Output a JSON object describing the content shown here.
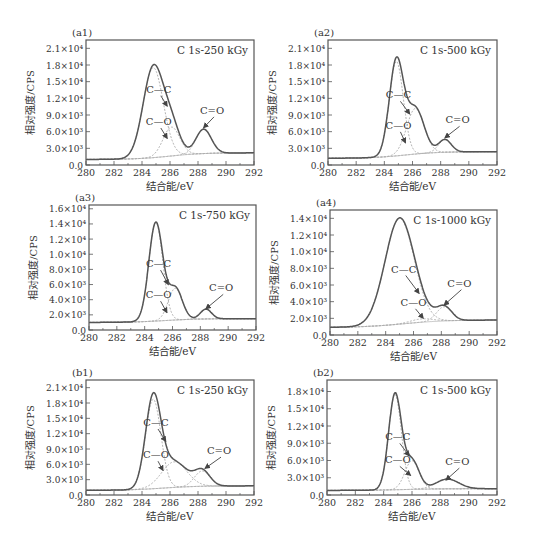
{
  "figure": {
    "common": {
      "xlabel": "结合能/eV",
      "ylabel": "相对强度/CPS",
      "x_ticks": [
        280,
        282,
        284,
        286,
        288,
        290,
        292
      ],
      "xlim": [
        280,
        292
      ],
      "line_color": "#555555",
      "fit_color": "#aaaaaa"
    }
  },
  "chart_data": [
    {
      "id": "a1",
      "panel_label": "(a1)",
      "type": "line",
      "title": "C 1s-250 kGy",
      "xlabel": "结合能/eV",
      "ylabel": "相对强度/CPS",
      "xlim": [
        280,
        292
      ],
      "ylim": [
        0,
        22500
      ],
      "y_ticks": [
        0,
        3000,
        6000,
        9000,
        12000,
        15000,
        18000,
        21000
      ],
      "y_tick_labels": [
        "0.0",
        "3.0×10³",
        "6.0×10³",
        "9.0×10³",
        "1.2×10⁴",
        "1.5×10⁴",
        "1.8×10⁴",
        "2.1×10⁴"
      ],
      "baseline": {
        "start": 1000,
        "end": 2200,
        "center": 286,
        "width": 1.2
      },
      "peaks": [
        {
          "name": "C—C",
          "center": 284.8,
          "height": 16200,
          "sigma": 0.72
        },
        {
          "name": "C—O",
          "center": 286.1,
          "height": 5200,
          "sigma": 0.6
        },
        {
          "name": "C=O",
          "center": 288.4,
          "height": 4400,
          "sigma": 0.55
        }
      ],
      "annotations": [
        {
          "text": "C—C",
          "tx": 285.2,
          "ty": 13000,
          "ax": 285.8,
          "ay": 10600
        },
        {
          "text": "C—O",
          "tx": 285.2,
          "ty": 7200,
          "ax": 285.8,
          "ay": 4800
        },
        {
          "text": "C=O",
          "tx": 289.0,
          "ty": 9200,
          "ax": 288.4,
          "ay": 6700
        }
      ],
      "box": {
        "x": 86,
        "y": 40,
        "w": 168,
        "h": 125
      }
    },
    {
      "id": "a2",
      "panel_label": "(a2)",
      "type": "line",
      "title": "C 1s-500 kGy",
      "xlabel": "结合能/eV",
      "ylabel": "相对强度/CPS",
      "xlim": [
        280,
        292
      ],
      "ylim": [
        0,
        22500
      ],
      "y_ticks": [
        0,
        3000,
        6000,
        9000,
        12000,
        15000,
        18000,
        21000
      ],
      "y_tick_labels": [
        "0.0",
        "3.0×10³",
        "6.0×10³",
        "9.0×10³",
        "1.2×10⁴",
        "1.5×10⁴",
        "1.8×10⁴",
        "2.1×10⁴"
      ],
      "baseline": {
        "start": 1200,
        "end": 2400,
        "center": 285.5,
        "width": 1.2
      },
      "peaks": [
        {
          "name": "C—C",
          "center": 284.85,
          "height": 17000,
          "sigma": 0.5
        },
        {
          "name": "C—O",
          "center": 286.2,
          "height": 8200,
          "sigma": 0.62
        },
        {
          "name": "C=O",
          "center": 288.3,
          "height": 2300,
          "sigma": 0.45
        }
      ],
      "annotations": [
        {
          "text": "C—C",
          "tx": 285.0,
          "ty": 12000,
          "ax": 285.8,
          "ay": 9200
        },
        {
          "text": "C—O",
          "tx": 285.0,
          "ty": 6500,
          "ax": 285.5,
          "ay": 4000
        },
        {
          "text": "C=O",
          "tx": 289.2,
          "ty": 7500,
          "ax": 288.3,
          "ay": 4900
        }
      ],
      "box": {
        "x": 328,
        "y": 40,
        "w": 169,
        "h": 125
      }
    },
    {
      "id": "a3",
      "panel_label": "(a3)",
      "type": "line",
      "title": "C 1s-750 kGy",
      "xlabel": "结合能/eV",
      "ylabel": "相对强度/CPS",
      "xlim": [
        280,
        292
      ],
      "ylim": [
        0,
        16500
      ],
      "y_ticks": [
        0,
        2000,
        4000,
        6000,
        8000,
        10000,
        12000,
        14000,
        16000
      ],
      "y_tick_labels": [
        "0.0",
        "2.0×10³",
        "4.0×10³",
        "6.0×10³",
        "8.0×10³",
        "1.0×10⁴",
        "1.2×10⁴",
        "1.4×10⁴",
        "1.6×10⁴"
      ],
      "baseline": {
        "start": 1000,
        "end": 1500,
        "center": 285.5,
        "width": 1.2
      },
      "peaks": [
        {
          "name": "C—C",
          "center": 284.8,
          "height": 13000,
          "sigma": 0.5
        },
        {
          "name": "C—O",
          "center": 286.2,
          "height": 4200,
          "sigma": 0.5
        },
        {
          "name": "C=O",
          "center": 288.4,
          "height": 1300,
          "sigma": 0.4
        }
      ],
      "annotations": [
        {
          "text": "C—C",
          "tx": 285.0,
          "ty": 8300,
          "ax": 285.7,
          "ay": 6000
        },
        {
          "text": "C—O",
          "tx": 285.0,
          "ty": 4200,
          "ax": 285.6,
          "ay": 2300
        },
        {
          "text": "C=O",
          "tx": 289.5,
          "ty": 5100,
          "ax": 288.4,
          "ay": 2800
        }
      ],
      "box": {
        "x": 89,
        "y": 205,
        "w": 167,
        "h": 125
      }
    },
    {
      "id": "a4",
      "panel_label": "(a4)",
      "type": "line",
      "title": "C 1s-1000 kGy",
      "xlabel": "结合能/eV",
      "ylabel": "相对强度/CPS",
      "xlim": [
        280,
        292
      ],
      "ylim": [
        0,
        15000
      ],
      "y_ticks": [
        0,
        2000,
        4000,
        6000,
        8000,
        10000,
        12000,
        14000
      ],
      "y_tick_labels": [
        "0.0",
        "2.0×10³",
        "4.0×10³",
        "6.0×10³",
        "8.0×10³",
        "1.0×10⁴",
        "1.2×10⁴",
        "1.4×10⁴"
      ],
      "baseline": {
        "start": 900,
        "end": 1800,
        "center": 285.3,
        "width": 1.5
      },
      "peaks": [
        {
          "name": "C—C",
          "center": 285.0,
          "height": 12700,
          "sigma": 1.05
        },
        {
          "name": "C—O",
          "center": 286.6,
          "height": 400,
          "sigma": 0.8
        },
        {
          "name": "C=O",
          "center": 288.2,
          "height": 1700,
          "sigma": 0.55
        }
      ],
      "annotations": [
        {
          "text": "C—C",
          "tx": 285.3,
          "ty": 7500,
          "ax": 286.4,
          "ay": 5000
        },
        {
          "text": "C—O",
          "tx": 286.0,
          "ty": 3500,
          "ax": 286.7,
          "ay": 2000
        },
        {
          "text": "C=O",
          "tx": 289.3,
          "ty": 5800,
          "ax": 288.2,
          "ay": 3600
        }
      ],
      "box": {
        "x": 330,
        "y": 210,
        "w": 167,
        "h": 125
      }
    },
    {
      "id": "b1",
      "panel_label": "(b1)",
      "type": "line",
      "title": "C 1s-250 kGy",
      "xlabel": "结合能/eV",
      "ylabel": "相对强度/CPS",
      "xlim": [
        280,
        292
      ],
      "ylim": [
        0,
        22500
      ],
      "y_ticks": [
        0,
        3000,
        6000,
        9000,
        12000,
        15000,
        18000,
        21000
      ],
      "y_tick_labels": [
        "0.0",
        "3.0×10³",
        "6.0×10³",
        "9.0×10³",
        "1.2×10⁴",
        "1.5×10⁴",
        "1.8×10⁴",
        "2.1×10⁴"
      ],
      "baseline": {
        "start": 900,
        "end": 1800,
        "center": 285.5,
        "width": 1.3
      },
      "peaks": [
        {
          "name": "C—C",
          "center": 284.8,
          "height": 17500,
          "sigma": 0.55
        },
        {
          "name": "C—O",
          "center": 286.3,
          "height": 5000,
          "sigma": 0.9
        },
        {
          "name": "C=O",
          "center": 288.3,
          "height": 3000,
          "sigma": 0.55
        }
      ],
      "annotations": [
        {
          "text": "C—C",
          "tx": 285.0,
          "ty": 13500,
          "ax": 285.7,
          "ay": 10500
        },
        {
          "text": "C—O",
          "tx": 285.0,
          "ty": 7200,
          "ax": 285.5,
          "ay": 4800
        },
        {
          "text": "C=O",
          "tx": 289.5,
          "ty": 8000,
          "ax": 288.5,
          "ay": 5200
        }
      ],
      "box": {
        "x": 86,
        "y": 380,
        "w": 168,
        "h": 115
      }
    },
    {
      "id": "b2",
      "panel_label": "(b2)",
      "type": "line",
      "title": "C 1s-500 kGy",
      "xlabel": "结合能/eV",
      "ylabel": "相对强度/CPS",
      "xlim": [
        280,
        292
      ],
      "ylim": [
        0,
        20000
      ],
      "y_ticks": [
        0,
        3000,
        6000,
        9000,
        12000,
        15000,
        18000
      ],
      "y_tick_labels": [
        "0.0",
        "3.0×10³",
        "6.0×10³",
        "9.0×10³",
        "1.2×10⁴",
        "1.5×10⁴",
        "1.8×10⁴"
      ],
      "baseline": {
        "start": 800,
        "end": 1100,
        "center": 285.5,
        "width": 1.3
      },
      "peaks": [
        {
          "name": "C—C",
          "center": 284.8,
          "height": 16600,
          "sigma": 0.45
        },
        {
          "name": "C—O",
          "center": 286.0,
          "height": 5000,
          "sigma": 0.5
        },
        {
          "name": "C=O",
          "center": 288.5,
          "height": 1700,
          "sigma": 0.8
        }
      ],
      "annotations": [
        {
          "text": "C—C",
          "tx": 285.0,
          "ty": 9500,
          "ax": 285.8,
          "ay": 6800
        },
        {
          "text": "C—O",
          "tx": 285.0,
          "ty": 5500,
          "ax": 285.9,
          "ay": 3400
        },
        {
          "text": "C=O",
          "tx": 289.2,
          "ty": 5200,
          "ax": 288.4,
          "ay": 2600
        }
      ],
      "box": {
        "x": 327,
        "y": 380,
        "w": 170,
        "h": 115
      }
    }
  ]
}
